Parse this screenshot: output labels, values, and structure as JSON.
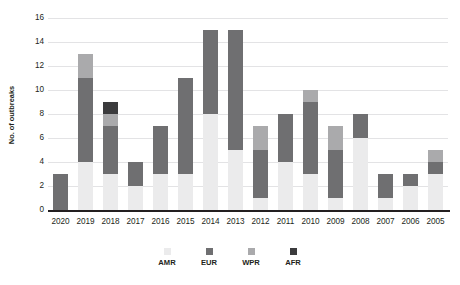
{
  "chart_data": {
    "type": "bar",
    "subtype": "stacked-bar",
    "title": "",
    "xlabel": "",
    "ylabel": "No. of outbreaks",
    "ylim": [
      0,
      16
    ],
    "yticks": [
      0,
      2,
      4,
      6,
      8,
      10,
      12,
      14,
      16
    ],
    "grid": true,
    "legend_position": "bottom",
    "categories": [
      "2020",
      "2019",
      "2018",
      "2017",
      "2016",
      "2015",
      "2014",
      "2013",
      "2012",
      "2011",
      "2010",
      "2009",
      "2008",
      "2007",
      "2006",
      "2005"
    ],
    "series": [
      {
        "name": "AMR",
        "color": "#ebebec",
        "values": [
          0,
          4,
          3,
          2,
          3,
          3,
          8,
          5,
          1,
          4,
          3,
          1,
          6,
          1,
          2,
          3
        ]
      },
      {
        "name": "EUR",
        "color": "#6f6f71",
        "values": [
          3,
          7,
          4,
          2,
          4,
          8,
          7,
          10,
          4,
          4,
          6,
          4,
          2,
          2,
          1,
          1
        ]
      },
      {
        "name": "WPR",
        "color": "#aaaaac",
        "values": [
          0,
          2,
          1,
          0,
          0,
          0,
          0,
          0,
          2,
          0,
          1,
          2,
          0,
          0,
          0,
          1
        ]
      },
      {
        "name": "AFR",
        "color": "#3b3b3d",
        "values": [
          0,
          0,
          1,
          0,
          0,
          0,
          0,
          0,
          0,
          0,
          0,
          0,
          0,
          0,
          0,
          0
        ]
      }
    ],
    "totals": [
      3,
      13,
      9,
      4,
      7,
      11,
      15,
      15,
      7,
      8,
      10,
      7,
      8,
      3,
      3,
      5
    ]
  },
  "legend": {
    "items": [
      {
        "label": "AMR",
        "color": "#ebebec"
      },
      {
        "label": "EUR",
        "color": "#6f6f71"
      },
      {
        "label": "WPR",
        "color": "#aaaaac"
      },
      {
        "label": "AFR",
        "color": "#3b3b3d"
      }
    ]
  },
  "axes": {
    "y_title": "No. of outbreaks"
  }
}
